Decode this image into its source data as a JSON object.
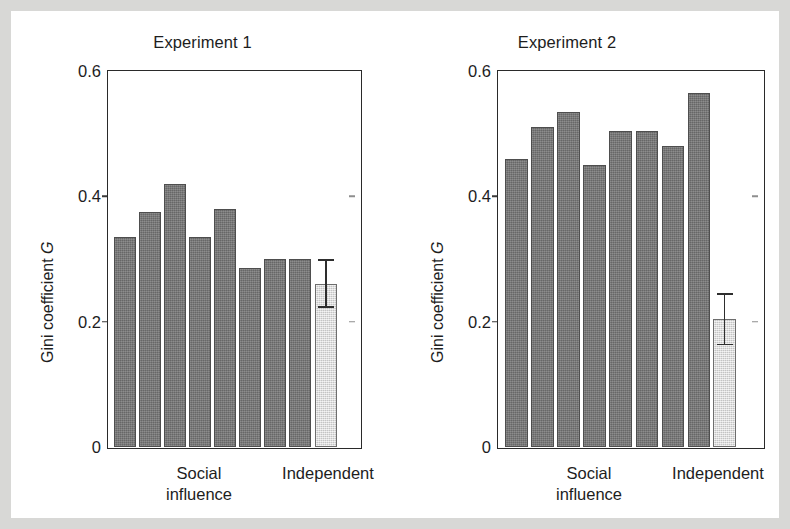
{
  "figure": {
    "border_color": "#d8d8d6",
    "background": "#ffffff"
  },
  "colors": {
    "social_bar": "#737373",
    "independent_bar": "#d6d6d6",
    "axis": "#2a2a2a",
    "text": "#1d1d1d"
  },
  "chart_data": [
    {
      "type": "bar",
      "title": "Experiment 1",
      "xlabel": "",
      "ylabel": "Gini coefficient G",
      "ylim": [
        0,
        0.6
      ],
      "yticks": [
        0,
        0.2,
        0.4,
        0.6
      ],
      "ytick_labels": [
        "0",
        "0.2",
        "0.4",
        "0.6"
      ],
      "grid": false,
      "legend": "none",
      "categories": [
        "Social influence",
        "Independent"
      ],
      "group_labels": {
        "social": "Social\ninfluence",
        "independent": "Independent"
      },
      "series": [
        {
          "name": "Social influence",
          "values": [
            0.335,
            0.375,
            0.42,
            0.335,
            0.38,
            0.285,
            0.3,
            0.3
          ]
        },
        {
          "name": "Independent",
          "values": [
            0.26
          ],
          "errors": [
            {
              "lower": 0.225,
              "upper": 0.3
            }
          ]
        }
      ]
    },
    {
      "type": "bar",
      "title": "Experiment 2",
      "xlabel": "",
      "ylabel": "Gini coefficient G",
      "ylim": [
        0,
        0.6
      ],
      "yticks": [
        0,
        0.2,
        0.4,
        0.6
      ],
      "ytick_labels": [
        "0",
        "0.2",
        "0.4",
        "0.6"
      ],
      "grid": false,
      "legend": "none",
      "categories": [
        "Social influence",
        "Independent"
      ],
      "group_labels": {
        "social": "Social\ninfluence",
        "independent": "Independent"
      },
      "series": [
        {
          "name": "Social influence",
          "values": [
            0.46,
            0.51,
            0.535,
            0.45,
            0.505,
            0.505,
            0.48,
            0.565
          ]
        },
        {
          "name": "Independent",
          "values": [
            0.205
          ],
          "errors": [
            {
              "lower": 0.165,
              "upper": 0.245
            }
          ]
        }
      ]
    }
  ]
}
